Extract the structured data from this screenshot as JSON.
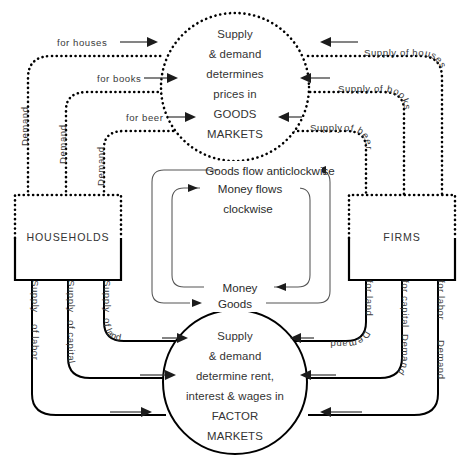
{
  "diagram": {
    "width": 470,
    "height": 468,
    "background": "#ffffff",
    "ink_color": "#000000",
    "text_color": "#333333"
  },
  "goods_market": {
    "style": "dotted",
    "lines": [
      "Supply",
      "& demand",
      "determines",
      "prices in",
      "GOODS",
      "MARKETS"
    ]
  },
  "factor_market": {
    "style": "solid",
    "lines": [
      "Supply",
      "& demand",
      "determine rent,",
      "interest & wages in",
      "FACTOR",
      "MARKETS"
    ]
  },
  "sectors": {
    "households": "HOUSEHOLDS",
    "firms": "FIRMS"
  },
  "center": {
    "outer_top": "Goods flow anticlockwise",
    "inner_top_line1": "Money flows",
    "inner_top_line2": "clockwise",
    "inner_bottom": "Money",
    "outer_bottom": "Goods"
  },
  "flows": {
    "demand_goods": [
      {
        "lead": "Demand",
        "tail": "for houses"
      },
      {
        "lead": "Demand",
        "tail": "for books"
      },
      {
        "lead": "Demand",
        "tail": "for beer"
      }
    ],
    "supply_goods": [
      {
        "lead": "Supply",
        "tail": "of houses"
      },
      {
        "lead": "Supply",
        "tail": "of books"
      },
      {
        "lead": "Supply",
        "tail": "of beer"
      }
    ],
    "supply_factors": [
      {
        "lead": "Supply",
        "tail": "of land"
      },
      {
        "lead": "Supply",
        "tail": "of capital"
      },
      {
        "lead": "Supply",
        "tail": "of labor"
      }
    ],
    "demand_factors": [
      {
        "lead": "Demand",
        "tail": "for land"
      },
      {
        "lead": "Demand",
        "tail": "for capital"
      },
      {
        "lead": "Demand",
        "tail": "for labor"
      }
    ]
  }
}
